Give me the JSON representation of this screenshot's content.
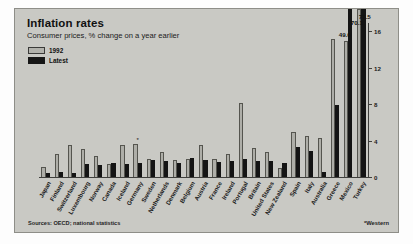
{
  "header": {
    "title": "Inflation rates",
    "subtitle": "Consumer prices, % change on a year earlier"
  },
  "legend": {
    "items": [
      {
        "label": "1992",
        "color": "#aeaea8"
      },
      {
        "label": "Latest",
        "color": "#141414"
      }
    ]
  },
  "notes": {
    "source": "Sources: OECD; national statistics",
    "footnote": "*Western"
  },
  "callouts": [
    {
      "label": "49.0",
      "series": "latest",
      "category": "Mexico"
    },
    {
      "label": "70.1",
      "series": "1992",
      "category": "Turkey"
    },
    {
      "label": "77.5",
      "series": "latest",
      "category": "Turkey"
    }
  ],
  "chart_data": {
    "type": "bar",
    "title": "Inflation rates",
    "subtitle": "Consumer prices, % change on a year earlier",
    "xlabel": "",
    "ylabel": "",
    "ylim": [
      0,
      17
    ],
    "yticks": [
      0,
      4,
      8,
      12,
      16
    ],
    "ytick_labels": [
      "0",
      "4",
      "8",
      "12",
      "16"
    ],
    "axis_position": "right",
    "grid": false,
    "legend_position": "top-left",
    "note": "Mexico and Turkey bars exceed the axis maximum and are labelled with their true values (49.0, 70.1, 77.5).",
    "categories": [
      "Japan",
      "Finland",
      "Switzerland",
      "Luxembourg",
      "Norway",
      "Canada",
      "Iceland",
      "Germany",
      "Sweden",
      "Netherlands",
      "Denmark",
      "Belgium",
      "Austria",
      "France",
      "Ireland",
      "Portugal",
      "Britain",
      "United States",
      "New Zealand",
      "Spain",
      "Italy",
      "Australia",
      "Greece",
      "Mexico",
      "Turkey"
    ],
    "category_annotations": {
      "Germany": "*"
    },
    "series": [
      {
        "name": "1992",
        "color": "#aeaea8",
        "values": [
          1.2,
          2.6,
          3.6,
          3.2,
          2.4,
          1.5,
          3.6,
          3.7,
          2.1,
          2.9,
          2.0,
          2.1,
          3.6,
          2.1,
          2.6,
          8.2,
          3.3,
          2.8,
          1.1,
          5.0,
          4.6,
          4.4,
          15.3,
          15.0,
          70.1
        ]
      },
      {
        "name": "Latest",
        "color": "#141414",
        "values": [
          0.6,
          0.7,
          0.5,
          1.5,
          1.4,
          1.6,
          1.5,
          1.6,
          2.0,
          1.9,
          1.7,
          2.2,
          2.0,
          1.8,
          1.9,
          2.1,
          1.9,
          1.9,
          1.7,
          3.4,
          3.0,
          0.7,
          8.0,
          49.0,
          77.5
        ]
      }
    ]
  }
}
